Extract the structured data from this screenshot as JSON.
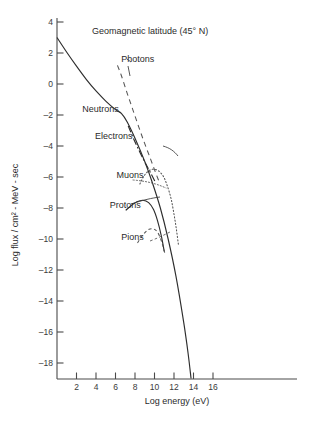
{
  "chart_data": {
    "type": "line",
    "title": "Geomagnetic latitude (45° N)",
    "xlabel": "Log energy (eV)",
    "ylabel": "Log flux / cm² - MeV - sec",
    "xlim": [
      0,
      17
    ],
    "ylim": [
      -19,
      4
    ],
    "grid": false,
    "legend_position": "inline-annotations",
    "xticks": [
      2,
      4,
      6,
      8,
      10,
      12,
      14,
      16
    ],
    "xtick_labels": [
      "2",
      "4",
      "6",
      "8",
      "10",
      "12",
      "14",
      "16"
    ],
    "yticks": [
      4,
      2,
      0,
      -2,
      -4,
      -6,
      -8,
      -10,
      -12,
      -14,
      -16,
      -18
    ],
    "ytick_labels": [
      "4",
      "2",
      "0",
      "–2",
      "–4",
      "–6",
      "–8",
      "–10",
      "–12",
      "–14",
      "–16",
      "–18"
    ],
    "series": [
      {
        "name": "Neutrons",
        "style": "solid",
        "label": "Neutrons",
        "label_x": 2.6,
        "label_y": -1.6,
        "points": [
          [
            0.0,
            3.0
          ],
          [
            1.0,
            2.05
          ],
          [
            2.0,
            1.15
          ],
          [
            3.0,
            0.3
          ],
          [
            4.0,
            -0.45
          ],
          [
            5.0,
            -1.1
          ],
          [
            6.0,
            -1.65
          ],
          [
            6.6,
            -1.9
          ],
          [
            7.2,
            -2.45
          ],
          [
            8.0,
            -3.5
          ],
          [
            9.0,
            -5.0
          ],
          [
            9.8,
            -6.4
          ],
          [
            10.6,
            -8.0
          ],
          [
            11.4,
            -10.0
          ],
          [
            12.2,
            -12.4
          ],
          [
            13.0,
            -15.4
          ],
          [
            13.45,
            -17.4
          ],
          [
            13.75,
            -19.0
          ]
        ]
      },
      {
        "name": "Photons",
        "style": "dashed",
        "label": "Photons",
        "label_x": 6.6,
        "label_y": 1.6,
        "points": [
          [
            6.2,
            1.2
          ],
          [
            6.6,
            0.55
          ],
          [
            7.2,
            -0.6
          ],
          [
            7.8,
            -1.7
          ],
          [
            8.4,
            -2.8
          ],
          [
            9.0,
            -3.85
          ],
          [
            9.6,
            -4.85
          ],
          [
            10.1,
            -5.7
          ],
          [
            10.5,
            -6.35
          ]
        ]
      },
      {
        "name": "Electrons",
        "style": "dash-dot",
        "label": "Electrons",
        "label_x": 3.9,
        "label_y": -3.35,
        "points": [
          [
            7.3,
            -2.7
          ],
          [
            7.9,
            -3.6
          ],
          [
            8.5,
            -4.4
          ],
          [
            9.1,
            -5.15
          ],
          [
            9.7,
            -5.85
          ],
          [
            10.1,
            -6.35
          ]
        ]
      },
      {
        "name": "Muons",
        "style": "dotted",
        "label": "Muons",
        "label_x": 6.1,
        "label_y": -5.9,
        "points": [
          [
            8.5,
            -6.45
          ],
          [
            8.9,
            -5.95
          ],
          [
            9.4,
            -5.6
          ],
          [
            9.9,
            -5.5
          ],
          [
            10.4,
            -5.6
          ],
          [
            10.9,
            -5.95
          ],
          [
            11.3,
            -6.55
          ],
          [
            11.7,
            -7.4
          ],
          [
            12.0,
            -8.4
          ],
          [
            12.25,
            -9.4
          ],
          [
            12.45,
            -10.35
          ]
        ]
      },
      {
        "name": "Protons",
        "style": "solid",
        "label": "Protons",
        "label_x": 5.4,
        "label_y": -7.8,
        "points": [
          [
            7.05,
            -8.15
          ],
          [
            7.6,
            -7.85
          ],
          [
            8.2,
            -7.6
          ],
          [
            8.8,
            -7.5
          ],
          [
            9.4,
            -7.65
          ],
          [
            9.9,
            -8.1
          ],
          [
            10.3,
            -8.8
          ],
          [
            10.7,
            -9.8
          ],
          [
            11.0,
            -10.8
          ]
        ]
      },
      {
        "name": "Pions",
        "style": "dashed-fine",
        "label": "Pions",
        "label_x": 6.6,
        "label_y": -9.85,
        "points": [
          [
            8.25,
            -10.25
          ],
          [
            8.8,
            -9.75
          ],
          [
            9.35,
            -9.4
          ],
          [
            9.9,
            -9.35
          ],
          [
            10.35,
            -9.6
          ],
          [
            10.75,
            -10.2
          ],
          [
            11.05,
            -10.9
          ]
        ]
      }
    ],
    "annotations": [
      {
        "text": "Geomagnetic latitude (45° N)",
        "x": 6.2,
        "y": 3.0
      }
    ]
  },
  "colors": {
    "axis": "#4a4a4a",
    "curve": "#2d2d2d",
    "curve_secondary": "#555555",
    "text": "#2b2b2b",
    "background": "#ffffff"
  }
}
